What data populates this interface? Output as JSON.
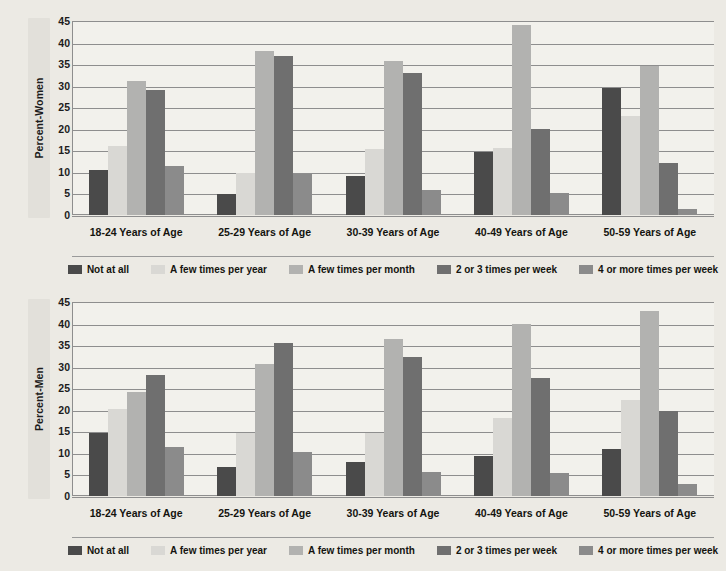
{
  "chart_data": [
    {
      "type": "bar",
      "title": "",
      "ylabel": "Percent-Women",
      "xlabel": "",
      "ylim": [
        0,
        45
      ],
      "yticks": [
        0,
        5,
        10,
        15,
        20,
        25,
        30,
        35,
        40,
        45
      ],
      "grid": true,
      "legend_position": "bottom",
      "categories": [
        "18-24 Years of Age",
        "25-29 Years of Age",
        "30-39 Years of Age",
        "40-49 Years of Age",
        "50-59 Years of Age"
      ],
      "series": [
        {
          "name": "Not at all",
          "color": "#4a4a4a",
          "values": [
            10.5,
            4.8,
            9.0,
            14.7,
            29.5
          ]
        },
        {
          "name": "A few times per year",
          "color": "#d9d8d4",
          "values": [
            16.0,
            9.7,
            15.2,
            15.5,
            23.0
          ]
        },
        {
          "name": "A few times per month",
          "color": "#b2b2b0",
          "values": [
            31.2,
            38.0,
            35.7,
            44.0,
            34.5
          ]
        },
        {
          "name": "2 or 3 times per week",
          "color": "#6f6f6f",
          "values": [
            29.0,
            36.8,
            33.0,
            20.0,
            12.0
          ]
        },
        {
          "name": "4 or more times per week",
          "color": "#8b8b8b",
          "values": [
            11.3,
            9.6,
            5.7,
            5.0,
            1.5
          ]
        }
      ]
    },
    {
      "type": "bar",
      "title": "",
      "ylabel": "Percent-Men",
      "xlabel": "",
      "ylim": [
        0,
        45
      ],
      "yticks": [
        0,
        5,
        10,
        15,
        20,
        25,
        30,
        35,
        40,
        45
      ],
      "grid": true,
      "legend_position": "bottom",
      "categories": [
        "18-24 Years of Age",
        "25-29 Years of Age",
        "30-39 Years of Age",
        "40-49 Years of Age",
        "50-59 Years of Age"
      ],
      "series": [
        {
          "name": "Not at all",
          "color": "#4a4a4a",
          "values": [
            14.7,
            6.8,
            7.8,
            9.3,
            10.8
          ]
        },
        {
          "name": "A few times per year",
          "color": "#d9d8d4",
          "values": [
            20.3,
            14.7,
            14.7,
            18.0,
            22.3
          ]
        },
        {
          "name": "A few times per month",
          "color": "#b2b2b0",
          "values": [
            24.2,
            30.6,
            36.4,
            40.0,
            43.0
          ]
        },
        {
          "name": "2 or 3 times per week",
          "color": "#6f6f6f",
          "values": [
            28.0,
            35.5,
            32.2,
            27.3,
            19.8
          ]
        },
        {
          "name": "4 or more times per week",
          "color": "#8b8b8b",
          "values": [
            11.3,
            10.3,
            5.5,
            5.3,
            2.7
          ]
        }
      ]
    }
  ]
}
